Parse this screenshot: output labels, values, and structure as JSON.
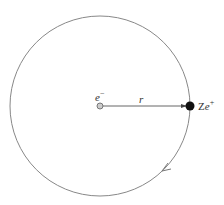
{
  "diagram": {
    "electron_label": "e",
    "electron_charge": "−",
    "radius_label": "r",
    "nucleus_label_z": "Z",
    "nucleus_label_e": "e",
    "nucleus_charge": "+",
    "colors": {
      "stroke": "#777777",
      "nucleus": "#111111",
      "electron_fill": "#bbbbbb"
    }
  }
}
